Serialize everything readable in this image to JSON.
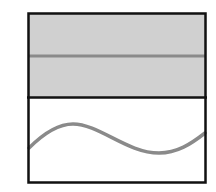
{
  "diagram": {
    "panels": [
      {
        "name": "top-panel",
        "fill": "#d0d0d0",
        "content": "horizontal-line",
        "line_color": "#8a8a8a"
      },
      {
        "name": "bottom-panel",
        "fill": "#ffffff",
        "content": "sine-wave",
        "line_color": "#8a8a8a"
      }
    ],
    "border_color": "#111111"
  }
}
